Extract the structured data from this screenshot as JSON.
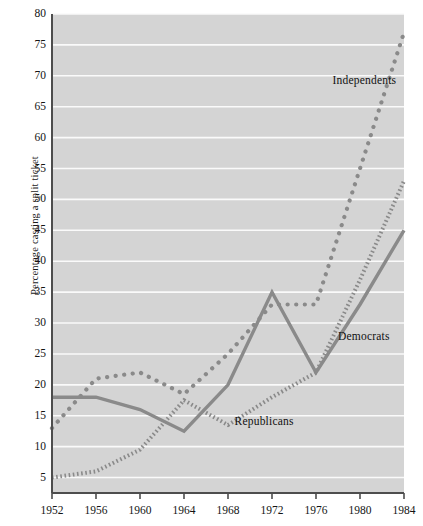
{
  "chart_data": {
    "type": "line",
    "title": "",
    "xlabel": "",
    "ylabel": "Percentage casting a split ticket",
    "xlim": [
      1952,
      1984
    ],
    "ylim": [
      2.5,
      80
    ],
    "grid": true,
    "legend_position": "inline-annotations",
    "x": [
      1952,
      1956,
      1960,
      1964,
      1968,
      1972,
      1976,
      1980,
      1984
    ],
    "xticks": [
      "1952",
      "1956",
      "1960",
      "1964",
      "1968",
      "1972",
      "1976",
      "1980",
      "1984"
    ],
    "yticks": [
      "5",
      "10",
      "15",
      "20",
      "25",
      "30",
      "35",
      "40",
      "45",
      "50",
      "55",
      "60",
      "65",
      "70",
      "75",
      "80"
    ],
    "series": [
      {
        "name": "Independents",
        "style": "dotted-large",
        "values": [
          13,
          21,
          22,
          18.5,
          25,
          33,
          33,
          55,
          77
        ],
        "label_x": 1977.5,
        "label_y": 69
      },
      {
        "name": "Democrats",
        "style": "solid",
        "values": [
          18,
          18,
          16,
          12.5,
          20,
          35,
          22,
          33,
          45
        ],
        "label_x": 1978.0,
        "label_y": 27.5
      },
      {
        "name": "Republicans",
        "style": "dotted-fine",
        "values": [
          5,
          6,
          9.5,
          17.5,
          13.5,
          18,
          22,
          37,
          53
        ],
        "label_x": 1968.6,
        "label_y": 13.8
      }
    ],
    "colors": {
      "plot_background": "#d4d4d4",
      "gridline": "#fafafa",
      "axis": "#4d4d4d",
      "series_line": "#8a8a8a",
      "text": "#141414",
      "page_background": "#ffffff"
    }
  },
  "axes": {
    "y_title": "Percentage casting a split ticket"
  }
}
